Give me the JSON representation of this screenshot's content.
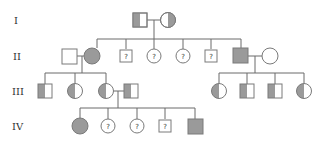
{
  "diagram": {
    "type": "pedigree",
    "colors": {
      "line": "#6b6b6b",
      "affected_fill": "#9a9a9a",
      "unaffected_fill": "#ffffff",
      "stroke": "#7a7a7a",
      "text": "#333333"
    },
    "generations": [
      {
        "label": "I",
        "y": 20
      },
      {
        "label": "II",
        "y": 56
      },
      {
        "label": "III",
        "y": 91
      },
      {
        "label": "IV",
        "y": 126
      }
    ],
    "individuals": [
      {
        "id": "I-1",
        "gen": "I",
        "sex": "male",
        "status": "carrier",
        "mark": ""
      },
      {
        "id": "I-2",
        "gen": "I",
        "sex": "female",
        "status": "carrier",
        "mark": ""
      },
      {
        "id": "II-1",
        "gen": "II",
        "sex": "male",
        "status": "unaffected",
        "mark": ""
      },
      {
        "id": "II-2",
        "gen": "II",
        "sex": "female",
        "status": "affected",
        "mark": ""
      },
      {
        "id": "II-3",
        "gen": "II",
        "sex": "male",
        "status": "unknown",
        "mark": "?"
      },
      {
        "id": "II-4",
        "gen": "II",
        "sex": "female",
        "status": "unknown",
        "mark": "?"
      },
      {
        "id": "II-5",
        "gen": "II",
        "sex": "female",
        "status": "unknown",
        "mark": "?"
      },
      {
        "id": "II-6",
        "gen": "II",
        "sex": "male",
        "status": "unknown",
        "mark": "?"
      },
      {
        "id": "II-7",
        "gen": "II",
        "sex": "male",
        "status": "affected",
        "mark": ""
      },
      {
        "id": "II-8",
        "gen": "II",
        "sex": "female",
        "status": "unaffected",
        "mark": ""
      },
      {
        "id": "III-1",
        "gen": "III",
        "sex": "male",
        "status": "carrier",
        "mark": ""
      },
      {
        "id": "III-2",
        "gen": "III",
        "sex": "female",
        "status": "carrier",
        "mark": ""
      },
      {
        "id": "III-3",
        "gen": "III",
        "sex": "female",
        "status": "carrier",
        "mark": ""
      },
      {
        "id": "III-4",
        "gen": "III",
        "sex": "male",
        "status": "carrier",
        "mark": ""
      },
      {
        "id": "III-5",
        "gen": "III",
        "sex": "female",
        "status": "carrier",
        "mark": ""
      },
      {
        "id": "III-6",
        "gen": "III",
        "sex": "male",
        "status": "carrier",
        "mark": ""
      },
      {
        "id": "III-7",
        "gen": "III",
        "sex": "male",
        "status": "carrier",
        "mark": ""
      },
      {
        "id": "III-8",
        "gen": "III",
        "sex": "female",
        "status": "carrier",
        "mark": ""
      },
      {
        "id": "IV-1",
        "gen": "IV",
        "sex": "female",
        "status": "affected",
        "mark": ""
      },
      {
        "id": "IV-2",
        "gen": "IV",
        "sex": "female",
        "status": "unknown",
        "mark": "?"
      },
      {
        "id": "IV-3",
        "gen": "IV",
        "sex": "female",
        "status": "unknown",
        "mark": "?"
      },
      {
        "id": "IV-4",
        "gen": "IV",
        "sex": "male",
        "status": "unknown",
        "mark": "?"
      },
      {
        "id": "IV-5",
        "gen": "IV",
        "sex": "male",
        "status": "affected",
        "mark": ""
      }
    ],
    "unknown_mark": "?"
  }
}
